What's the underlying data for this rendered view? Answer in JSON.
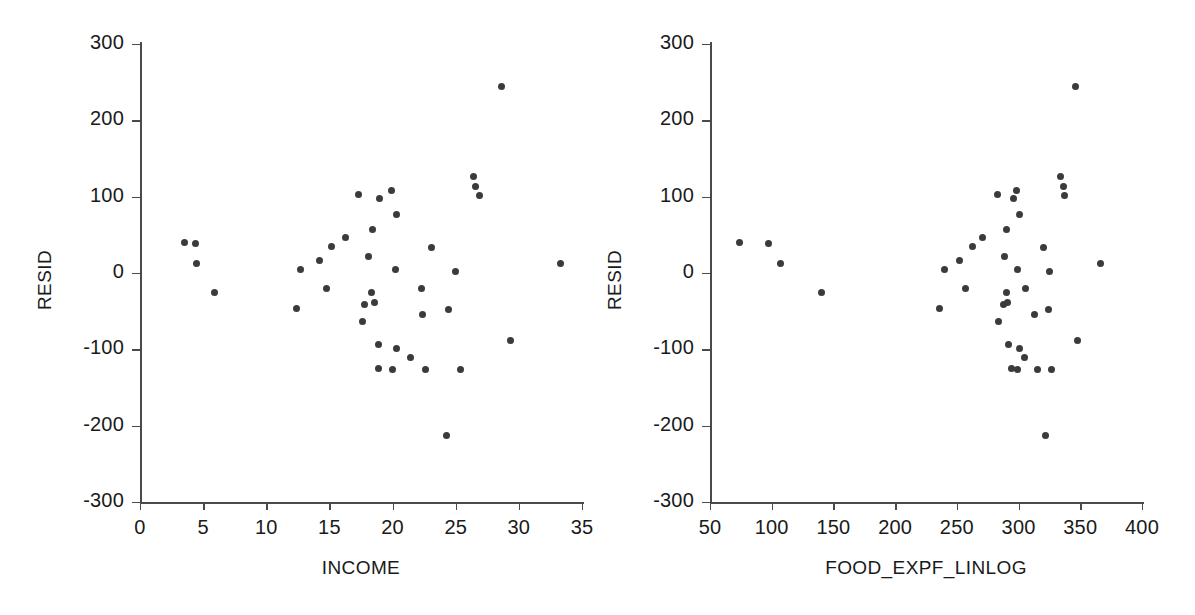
{
  "figure": {
    "background": "#ffffff",
    "point_color": "#3b3b3b",
    "axis_color": "#4a4a4a",
    "text_color": "#1a1a1a"
  },
  "chart_data": [
    {
      "type": "scatter",
      "title": "",
      "xlabel": "INCOME",
      "ylabel": "RESID",
      "xlim": [
        0,
        35
      ],
      "ylim": [
        -300,
        300
      ],
      "xticks": [
        0,
        5,
        10,
        15,
        20,
        25,
        30,
        35
      ],
      "yticks": [
        -300,
        -200,
        -100,
        0,
        100,
        200,
        300
      ],
      "xticklabels": [
        "0",
        "5",
        "10",
        "15",
        "20",
        "25",
        "30",
        "35"
      ],
      "yticklabels": [
        "-300",
        "-200",
        "-100",
        "0",
        "100",
        "200",
        "300"
      ],
      "grid": false,
      "legend": false,
      "n_points": 40,
      "x": [
        3.5,
        4.4,
        4.5,
        5.9,
        12.4,
        12.7,
        14.2,
        14.8,
        15.2,
        16.3,
        17.3,
        17.6,
        17.8,
        18.1,
        18.3,
        18.4,
        18.6,
        18.9,
        18.9,
        19.0,
        19.9,
        20.0,
        20.2,
        20.3,
        20.3,
        21.4,
        22.3,
        22.4,
        22.6,
        23.1,
        24.3,
        24.4,
        25.0,
        25.4,
        26.4,
        26.6,
        26.9,
        28.6,
        29.3,
        33.3
      ],
      "y": [
        40,
        38,
        12,
        -25,
        -47,
        4,
        16,
        -20,
        35,
        46,
        103,
        -63,
        -41,
        21,
        -26,
        57,
        -38,
        -94,
        -125,
        98,
        108,
        -126,
        4,
        77,
        -99,
        -111,
        -20,
        -55,
        -126,
        33,
        -213,
        -48,
        2,
        -126,
        126,
        113,
        101,
        244,
        -89,
        12
      ]
    },
    {
      "type": "scatter",
      "title": "",
      "xlabel": "FOOD_EXPF_LINLOG",
      "ylabel": "RESID",
      "xlim": [
        50,
        400
      ],
      "ylim": [
        -300,
        300
      ],
      "xticks": [
        50,
        100,
        150,
        200,
        250,
        300,
        350,
        400
      ],
      "yticks": [
        -300,
        -200,
        -100,
        0,
        100,
        200,
        300
      ],
      "xticklabels": [
        "50",
        "100",
        "150",
        "200",
        "250",
        "300",
        "350",
        "400"
      ],
      "yticklabels": [
        "-300",
        "-200",
        "-100",
        "0",
        "100",
        "200",
        "300"
      ],
      "grid": false,
      "legend": false,
      "n_points": 40,
      "x": [
        74,
        97,
        107,
        140,
        236,
        240,
        252,
        257,
        263,
        271,
        283,
        284,
        288,
        289,
        290,
        290,
        291,
        292,
        294,
        296,
        298,
        299,
        299,
        301,
        301,
        305,
        306,
        313,
        315,
        320,
        322,
        324,
        325,
        327,
        334,
        336,
        337,
        346,
        348,
        366
      ],
      "y": [
        40,
        38,
        12,
        -25,
        -47,
        4,
        16,
        -20,
        35,
        46,
        103,
        -63,
        -41,
        21,
        -26,
        57,
        -38,
        -94,
        -125,
        98,
        108,
        -126,
        4,
        77,
        -99,
        -111,
        -20,
        -55,
        -126,
        33,
        -213,
        -48,
        2,
        -126,
        126,
        113,
        101,
        244,
        -89,
        12
      ]
    }
  ]
}
